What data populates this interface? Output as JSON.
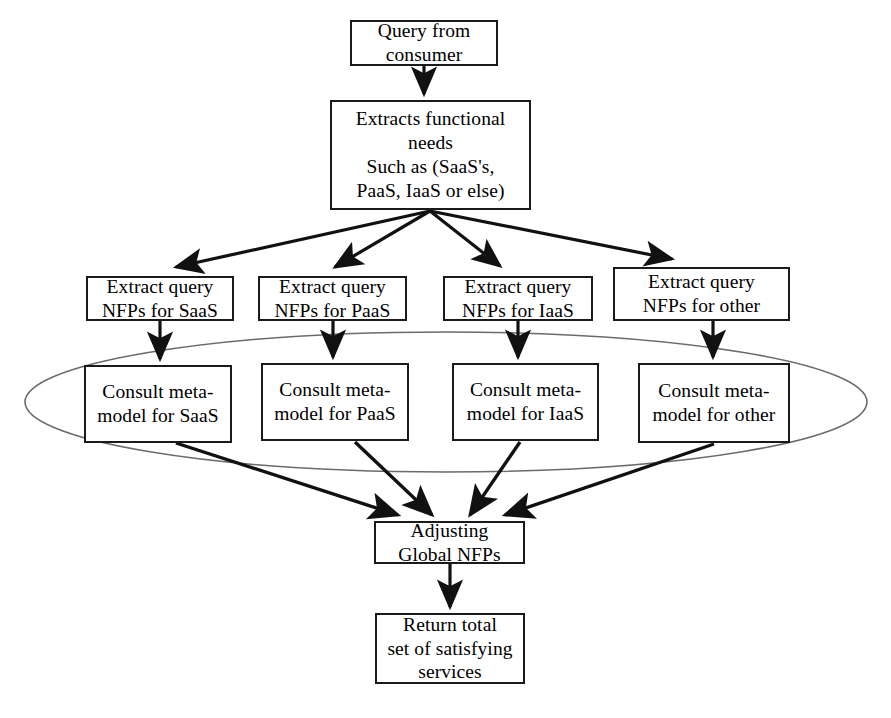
{
  "diagram": {
    "type": "flowchart",
    "title": "",
    "colors": {
      "node_border": "#1a1a1a",
      "node_fill": "#ffffff",
      "arrow": "#111111",
      "ellipse_stroke": "#6b6b6b",
      "background": "#ffffff"
    },
    "nodes": [
      {
        "id": "query",
        "label": "Query from\nconsumer",
        "shape": "rect",
        "x": 350,
        "y": 20,
        "w": 148,
        "h": 46
      },
      {
        "id": "extract_functional",
        "label": "Extracts functional\nneeds\nSuch as (SaaS's,\nPaaS, IaaS or else)",
        "shape": "rect",
        "x": 330,
        "y": 100,
        "w": 201,
        "h": 110
      },
      {
        "id": "extract_saas",
        "label": "Extract query\nNFPs for SaaS",
        "shape": "rect",
        "x": 86,
        "y": 276,
        "w": 148,
        "h": 45
      },
      {
        "id": "extract_paas",
        "label": "Extract query\nNFPs for PaaS",
        "shape": "rect",
        "x": 258,
        "y": 276,
        "w": 149,
        "h": 45
      },
      {
        "id": "extract_iaas",
        "label": "Extract query\nNFPs for IaaS",
        "shape": "rect",
        "x": 443,
        "y": 276,
        "w": 150,
        "h": 45
      },
      {
        "id": "extract_other",
        "label": "Extract query\nNFPs for other",
        "shape": "rect",
        "x": 613,
        "y": 267,
        "w": 177,
        "h": 54
      },
      {
        "id": "consult_saas",
        "label": "Consult meta-\nmodel for SaaS",
        "shape": "rect",
        "x": 84,
        "y": 365,
        "w": 148,
        "h": 78
      },
      {
        "id": "consult_paas",
        "label": "Consult meta-\nmodel for PaaS",
        "shape": "rect",
        "x": 261,
        "y": 363,
        "w": 148,
        "h": 78
      },
      {
        "id": "consult_iaas",
        "label": "Consult meta-\nmodel for IaaS",
        "shape": "rect",
        "x": 452,
        "y": 363,
        "w": 147,
        "h": 78
      },
      {
        "id": "consult_other",
        "label": "Consult meta-\nmodel for other",
        "shape": "rect",
        "x": 638,
        "y": 363,
        "w": 152,
        "h": 80
      },
      {
        "id": "adjusting",
        "label": "Adjusting\nGlobal NFPs",
        "shape": "rect",
        "x": 374,
        "y": 521,
        "w": 151,
        "h": 43
      },
      {
        "id": "return_total",
        "label": "Return total\nset of satisfying\nservices",
        "shape": "rect",
        "x": 375,
        "y": 613,
        "w": 150,
        "h": 71
      }
    ],
    "grouping_ellipse": {
      "id": "metamodel-group-ellipse",
      "cx": 446,
      "cy": 402,
      "rx": 421,
      "ry": 70
    },
    "edges": [
      {
        "from": "query",
        "to": "extract_functional"
      },
      {
        "from": "extract_functional",
        "to": "extract_saas"
      },
      {
        "from": "extract_functional",
        "to": "extract_paas"
      },
      {
        "from": "extract_functional",
        "to": "extract_iaas"
      },
      {
        "from": "extract_functional",
        "to": "extract_other"
      },
      {
        "from": "extract_saas",
        "to": "consult_saas"
      },
      {
        "from": "extract_paas",
        "to": "consult_paas"
      },
      {
        "from": "extract_iaas",
        "to": "consult_iaas"
      },
      {
        "from": "extract_other",
        "to": "consult_other"
      },
      {
        "from": "consult_saas",
        "to": "adjusting"
      },
      {
        "from": "consult_paas",
        "to": "adjusting"
      },
      {
        "from": "consult_iaas",
        "to": "adjusting"
      },
      {
        "from": "consult_other",
        "to": "adjusting"
      },
      {
        "from": "adjusting",
        "to": "return_total"
      }
    ]
  }
}
